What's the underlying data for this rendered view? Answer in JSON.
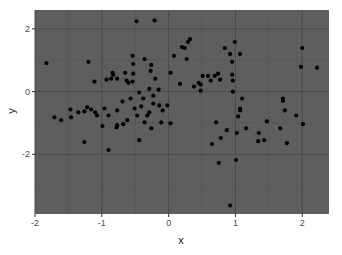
{
  "chart_data": {
    "type": "scatter",
    "title": "",
    "xlabel": "x",
    "ylabel": "y",
    "xlim": [
      -2.0,
      2.4
    ],
    "ylim": [
      -3.9,
      2.6
    ],
    "x_ticks": [
      -2,
      -1,
      0,
      1,
      2
    ],
    "y_ticks": [
      -2,
      0,
      2
    ],
    "grid": true,
    "legend": null,
    "theme": {
      "panel_background": "#5e5e5e",
      "major_grid": "#4a4a4a",
      "minor_grid": "#555555",
      "point_color": "#000000",
      "page_background": "#ffffff"
    },
    "points": [
      {
        "x": -1.83,
        "y": 0.91
      },
      {
        "x": -1.71,
        "y": -0.82
      },
      {
        "x": -1.2,
        "y": 0.95
      },
      {
        "x": -1.11,
        "y": 0.32
      },
      {
        "x": -0.93,
        "y": 0.38
      },
      {
        "x": -0.84,
        "y": 0.6
      },
      {
        "x": -0.86,
        "y": 0.41
      },
      {
        "x": -0.83,
        "y": 0.54
      },
      {
        "x": -0.77,
        "y": 0.41
      },
      {
        "x": -0.69,
        "y": -0.32
      },
      {
        "x": -0.96,
        "y": -0.54
      },
      {
        "x": -1.1,
        "y": -0.66
      },
      {
        "x": -1.16,
        "y": -0.57
      },
      {
        "x": -1.22,
        "y": -0.5
      },
      {
        "x": -1.26,
        "y": -0.63
      },
      {
        "x": -1.35,
        "y": -0.66
      },
      {
        "x": -1.47,
        "y": -0.57
      },
      {
        "x": -1.46,
        "y": -0.82
      },
      {
        "x": -1.61,
        "y": -0.91
      },
      {
        "x": -1.26,
        "y": -1.61
      },
      {
        "x": -1.07,
        "y": -0.76
      },
      {
        "x": -0.77,
        "y": -0.6
      },
      {
        "x": -0.57,
        "y": -0.22
      },
      {
        "x": -0.6,
        "y": 0.28
      },
      {
        "x": -0.65,
        "y": 0.6
      },
      {
        "x": -0.63,
        "y": 0.35
      },
      {
        "x": -0.54,
        "y": 0.32
      },
      {
        "x": -0.53,
        "y": 0.57
      },
      {
        "x": -0.38,
        "y": -0.22
      },
      {
        "x": -0.44,
        "y": -0.03
      },
      {
        "x": -0.48,
        "y": 2.24
      },
      {
        "x": -0.21,
        "y": 2.27
      },
      {
        "x": -0.54,
        "y": 1.14
      },
      {
        "x": -0.53,
        "y": 0.88
      },
      {
        "x": -0.36,
        "y": 1.04
      },
      {
        "x": -0.27,
        "y": 0.66
      },
      {
        "x": -0.26,
        "y": 0.85
      },
      {
        "x": -0.2,
        "y": 0.41
      },
      {
        "x": -0.29,
        "y": 0.09
      },
      {
        "x": -0.23,
        "y": -0.13
      },
      {
        "x": -0.14,
        "y": -0.44
      },
      {
        "x": -0.15,
        "y": 0.06
      },
      {
        "x": -0.09,
        "y": -0.6
      },
      {
        "x": -0.29,
        "y": -0.66
      },
      {
        "x": -0.36,
        "y": -0.98
      },
      {
        "x": -0.26,
        "y": -1.17
      },
      {
        "x": -0.11,
        "y": -0.98
      },
      {
        "x": -0.32,
        "y": -0.76
      },
      {
        "x": -0.41,
        "y": -0.47
      },
      {
        "x": -0.51,
        "y": -0.54
      },
      {
        "x": -0.62,
        "y": -0.91
      },
      {
        "x": -0.68,
        "y": -1.04
      },
      {
        "x": -0.77,
        "y": -1.07
      },
      {
        "x": -0.78,
        "y": -1.14
      },
      {
        "x": -0.9,
        "y": -0.76
      },
      {
        "x": -0.02,
        "y": -0.44
      },
      {
        "x": 0.03,
        "y": -1.01
      },
      {
        "x": 0.08,
        "y": 1.14
      },
      {
        "x": 0.03,
        "y": 0.6
      },
      {
        "x": 0.17,
        "y": 0.25
      },
      {
        "x": 0.2,
        "y": 1.42
      },
      {
        "x": 0.24,
        "y": 1.39
      },
      {
        "x": 0.27,
        "y": 1.04
      },
      {
        "x": 0.29,
        "y": 1.58
      },
      {
        "x": 0.32,
        "y": 1.67
      },
      {
        "x": 0.38,
        "y": 0.16
      },
      {
        "x": 0.45,
        "y": 0.28
      },
      {
        "x": 0.51,
        "y": 0.5
      },
      {
        "x": 0.48,
        "y": 0.22
      },
      {
        "x": 0.59,
        "y": 0.5
      },
      {
        "x": 0.48,
        "y": 0.03
      },
      {
        "x": 0.63,
        "y": 0.35
      },
      {
        "x": 0.69,
        "y": 0.5
      },
      {
        "x": 0.74,
        "y": 0.57
      },
      {
        "x": 0.77,
        "y": 0.38
      },
      {
        "x": 0.84,
        "y": 1.39
      },
      {
        "x": 0.92,
        "y": 1.2
      },
      {
        "x": 0.95,
        "y": 0.95
      },
      {
        "x": 0.99,
        "y": 1.58
      },
      {
        "x": 0.95,
        "y": 0.54
      },
      {
        "x": 0.96,
        "y": 0.35
      },
      {
        "x": 1.07,
        "y": 1.2
      },
      {
        "x": 0.96,
        "y": 0.0
      },
      {
        "x": 1.07,
        "y": -0.54
      },
      {
        "x": 1.1,
        "y": -0.22
      },
      {
        "x": 1.04,
        "y": -0.79
      },
      {
        "x": 0.71,
        "y": -0.98
      },
      {
        "x": 0.87,
        "y": -1.23
      },
      {
        "x": 0.78,
        "y": -1.48
      },
      {
        "x": 1.16,
        "y": -1.17
      },
      {
        "x": 1.35,
        "y": -1.32
      },
      {
        "x": 1.34,
        "y": -1.58
      },
      {
        "x": 1.43,
        "y": -1.55
      },
      {
        "x": 1.47,
        "y": -0.95
      },
      {
        "x": 1.67,
        "y": -1.17
      },
      {
        "x": 1.71,
        "y": -0.22
      },
      {
        "x": 1.71,
        "y": -0.29
      },
      {
        "x": 1.74,
        "y": -0.6
      },
      {
        "x": 1.91,
        "y": -0.76
      },
      {
        "x": 2.0,
        "y": 1.39
      },
      {
        "x": 1.98,
        "y": 0.79
      },
      {
        "x": 2.22,
        "y": 0.76
      },
      {
        "x": 1.77,
        "y": -1.64
      },
      {
        "x": 2.01,
        "y": -1.04
      },
      {
        "x": 0.75,
        "y": -2.27
      },
      {
        "x": 0.65,
        "y": -1.67
      },
      {
        "x": 1.01,
        "y": -2.18
      },
      {
        "x": 1.02,
        "y": -1.32
      },
      {
        "x": 1.07,
        "y": -0.6
      },
      {
        "x": 0.92,
        "y": -3.63
      },
      {
        "x": -0.23,
        "y": -0.38
      },
      {
        "x": -0.47,
        "y": -0.76
      },
      {
        "x": -0.44,
        "y": -1.55
      },
      {
        "x": -0.9,
        "y": -1.86
      },
      {
        "x": -0.99,
        "y": -1.1
      }
    ]
  }
}
